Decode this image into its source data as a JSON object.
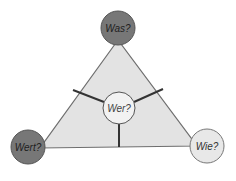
{
  "diagram": {
    "type": "triangle",
    "colors": {
      "triangle_fill": "#e3e3e3",
      "triangle_stroke": "#6e6e6e",
      "dark_node": "#777777",
      "light_node": "#e8e8e8",
      "center_node": "#f2f2f2",
      "spoke": "#333333",
      "node_stroke": "#555555"
    },
    "nodes": {
      "top": {
        "label": "Was?"
      },
      "bottom_left": {
        "label": "Wert?"
      },
      "bottom_right": {
        "label": "Wie?"
      },
      "center": {
        "label": "Wer?"
      }
    }
  }
}
